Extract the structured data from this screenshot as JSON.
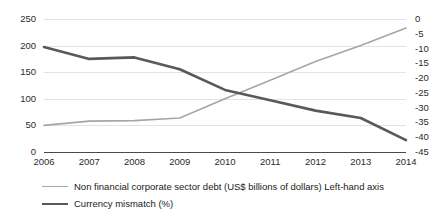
{
  "chart_data": {
    "type": "line",
    "title": "",
    "xlabel": "",
    "categories": [
      "2006",
      "2007",
      "2008",
      "2009",
      "2010",
      "2011",
      "2012",
      "2013",
      "2014"
    ],
    "grid": true,
    "legend_position": "bottom-left",
    "axes": {
      "left": {
        "label": "Non financial corporate sector debt (US$ billions of dollars)",
        "ticks": [
          "250",
          "200",
          "150",
          "100",
          "50",
          "0"
        ],
        "tick_values": [
          250,
          200,
          150,
          100,
          50,
          0
        ],
        "ylim": [
          0,
          250
        ]
      },
      "right": {
        "label": "Currency mismatch (%)",
        "ticks": [
          "0",
          "-5",
          "-10",
          "-15",
          "-20",
          "-25",
          "-30",
          "-35",
          "-40",
          "-45"
        ],
        "tick_values": [
          0,
          -5,
          -10,
          -15,
          -20,
          -25,
          -30,
          -35,
          -40,
          -45
        ],
        "ylim": [
          -45,
          0
        ]
      }
    },
    "series": [
      {
        "name": "Non financial corporate sector debt (US$ billions of dollars) Left-hand axis",
        "axis": "left",
        "color": "#a6a6a6",
        "values": [
          50,
          58,
          59,
          64,
          100,
          135,
          170,
          200,
          233
        ]
      },
      {
        "name": "Currency mismatch (%)",
        "axis": "right",
        "color": "#595959",
        "values": [
          -9.5,
          -13.5,
          -13,
          -17,
          -24,
          -27.5,
          -31,
          -33.5,
          -41
        ]
      }
    ]
  },
  "legend": {
    "items": [
      {
        "label": "Non financial corporate sector debt (US$ billions of dollars) Left-hand axis",
        "color": "#a6a6a6",
        "thickness": "1.6px"
      },
      {
        "label": "Currency mismatch (%)",
        "color": "#595959",
        "thickness": "2.6px"
      }
    ]
  }
}
